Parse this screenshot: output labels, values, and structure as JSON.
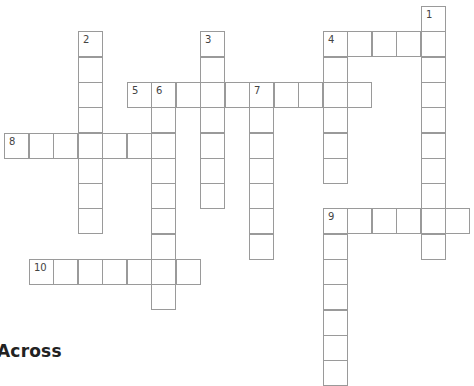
{
  "puzzle": {
    "cell_width": 24.5,
    "cell_height": 25.3,
    "origin_x": 4,
    "origin_y": 6,
    "border_color": "#9a9a9a",
    "entries": [
      {
        "number": "1",
        "direction": "down",
        "row": 0,
        "col": 17,
        "length": 10
      },
      {
        "number": "2",
        "direction": "down",
        "row": 1,
        "col": 3,
        "length": 8
      },
      {
        "number": "3",
        "direction": "down",
        "row": 1,
        "col": 8,
        "length": 7
      },
      {
        "number": "4",
        "direction": "across",
        "row": 1,
        "col": 13,
        "length": 5
      },
      {
        "number": "4",
        "direction": "down",
        "row": 1,
        "col": 13,
        "length": 6
      },
      {
        "number": "5",
        "direction": "across",
        "row": 3,
        "col": 5,
        "length": 10
      },
      {
        "number": "6",
        "direction": "down",
        "row": 3,
        "col": 6,
        "length": 9
      },
      {
        "number": "7",
        "direction": "down",
        "row": 3,
        "col": 10,
        "length": 7
      },
      {
        "number": "8",
        "direction": "across",
        "row": 5,
        "col": 0,
        "length": 7
      },
      {
        "number": "9",
        "direction": "across",
        "row": 8,
        "col": 13,
        "length": 6
      },
      {
        "number": "9",
        "direction": "down",
        "row": 8,
        "col": 13,
        "length": 7
      },
      {
        "number": "10",
        "direction": "across",
        "row": 10,
        "col": 1,
        "length": 7
      }
    ]
  },
  "clues": {
    "across_heading": "Across"
  }
}
